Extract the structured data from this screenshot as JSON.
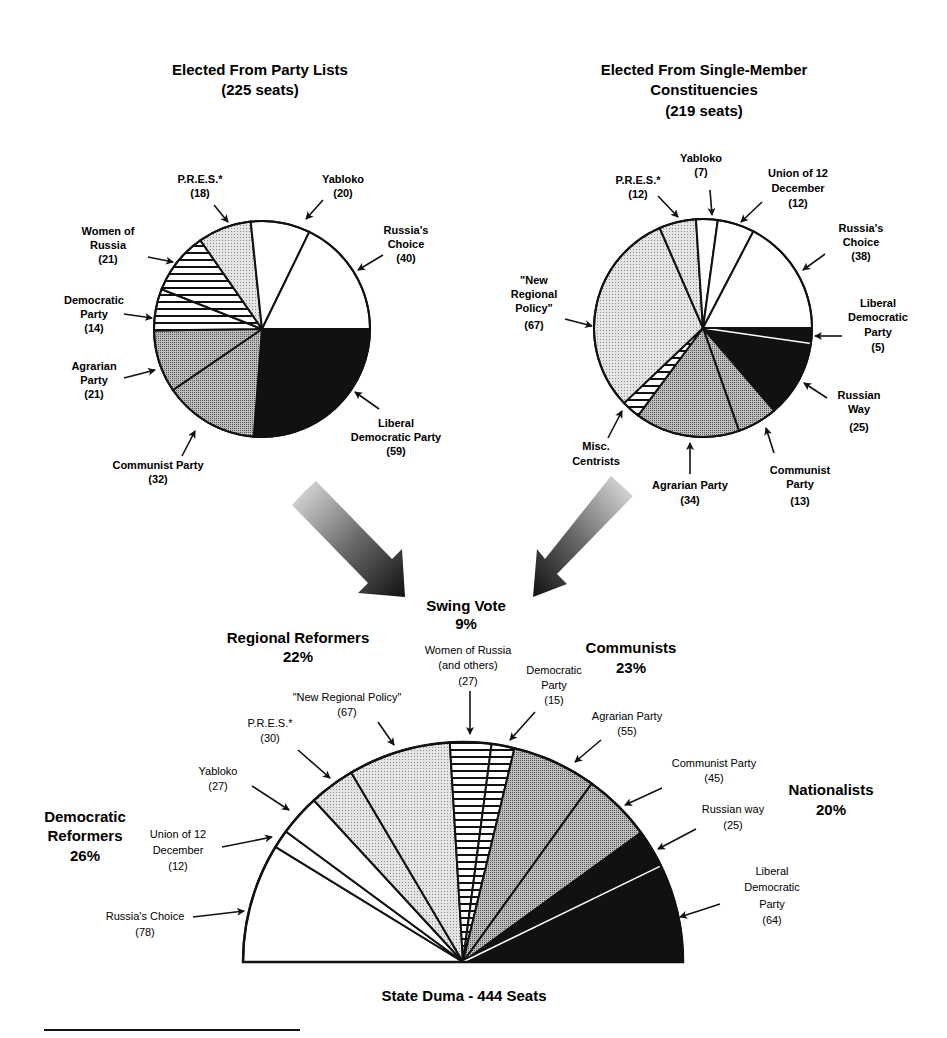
{
  "chart_data": [
    {
      "type": "pie",
      "title": "Elected From Party Lists",
      "subtitle": "(225 seats)",
      "categories": [
        "Liberal Democratic Party",
        "Communist Party",
        "Agrarian Party",
        "Democratic Party",
        "Women of Russia",
        "P.R.E.S.*",
        "Yabloko",
        "Russia's Choice"
      ],
      "values": [
        59,
        32,
        21,
        14,
        21,
        18,
        20,
        40
      ],
      "total": 225
    },
    {
      "type": "pie",
      "title": "Elected From Single-Member Constituencies",
      "subtitle": "(219 seats)",
      "categories": [
        "Liberal Democratic Party",
        "Russian Way",
        "Communist Party",
        "Agrarian Party",
        "Misc. Centrists",
        "\"New Regional Policy\"",
        "P.R.E.S.*",
        "Yabloko",
        "Union of 12 December",
        "Russia's Choice"
      ],
      "values": [
        5,
        25,
        13,
        34,
        6,
        67,
        12,
        7,
        12,
        38
      ],
      "total": 219
    },
    {
      "type": "pie",
      "subtype": "semicircle",
      "title": "State Duma - 444 Seats",
      "categories": [
        "Russia's Choice",
        "Union of 12 December",
        "Yabloko",
        "P.R.E.S.*",
        "\"New Regional Policy\"",
        "Women of Russia (and others)",
        "Democratic Party",
        "Agrarian Party",
        "Communist Party",
        "Russian way",
        "Liberal Democratic Party"
      ],
      "values": [
        78,
        12,
        27,
        30,
        67,
        27,
        15,
        55,
        45,
        25,
        64
      ],
      "blocs": [
        {
          "name": "Democratic Reformers",
          "share": "26%"
        },
        {
          "name": "Regional Reformers",
          "share": "22%"
        },
        {
          "name": "Swing Vote",
          "share": "9%"
        },
        {
          "name": "Communists",
          "share": "23%"
        },
        {
          "name": "Nationalists",
          "share": "20%"
        }
      ]
    }
  ],
  "left": {
    "title1": "Elected From Party Lists",
    "title2": "(225 seats)",
    "labels": {
      "pres": [
        "P.R.E.S.*",
        "(18)"
      ],
      "yabloko": [
        "Yabloko",
        "(20)"
      ],
      "russias_choice": [
        "Russia's",
        "Choice",
        "(40)"
      ],
      "women": [
        "Women of",
        "Russia",
        "(21)"
      ],
      "democratic": [
        "Democratic",
        "Party",
        "(14)"
      ],
      "agrarian": [
        "Agrarian",
        "Party",
        "(21)"
      ],
      "ldp": [
        "Liberal",
        "Democratic Party",
        "(59)"
      ],
      "communist": [
        "Communist Party",
        "(32)"
      ]
    }
  },
  "right": {
    "title1": "Elected From Single-Member",
    "title2": "Constituencies",
    "title3": "(219 seats)",
    "labels": {
      "pres": [
        "P.R.E.S.*",
        "(12)"
      ],
      "yabloko": [
        "Yabloko",
        "(7)"
      ],
      "union": [
        "Union of 12",
        "December",
        "(12)"
      ],
      "russias_choice": [
        "Russia's",
        "Choice",
        "(38)"
      ],
      "nrp": [
        "\"New",
        "Regional",
        "Policy\"",
        "(67)"
      ],
      "ldp": [
        "Liberal",
        "Democratic",
        "Party",
        "(5)"
      ],
      "russian_way": [
        "Russian",
        "Way",
        "(25)"
      ],
      "misc": [
        "Misc.",
        "Centrists"
      ],
      "agrarian": [
        "Agrarian Party",
        "(34)"
      ],
      "communist": [
        "Communist",
        "Party",
        "(13)"
      ]
    }
  },
  "bottom": {
    "title": "State Duma - 444 Seats",
    "blocs": {
      "swing": [
        "Swing Vote",
        "9%"
      ],
      "regional": [
        "Regional Reformers",
        "22%"
      ],
      "communists": [
        "Communists",
        "23%"
      ],
      "democratic": [
        "Democratic",
        "Reformers",
        "26%"
      ],
      "nationalists": [
        "Nationalists",
        "20%"
      ]
    },
    "labels": {
      "women": [
        "Women of Russia",
        "(and others)",
        "(27)"
      ],
      "democratic": [
        "Democratic",
        "Party",
        "(15)"
      ],
      "nrp": [
        "\"New Regional Policy\"",
        "(67)"
      ],
      "pres": [
        "P.R.E.S.*",
        "(30)"
      ],
      "yabloko": [
        "Yabloko",
        "(27)"
      ],
      "union": [
        "Union of 12",
        "December",
        "(12)"
      ],
      "russias_choice": [
        "Russia's Choice",
        "(78)"
      ],
      "agrarian": [
        "Agrarian Party",
        "(55)"
      ],
      "communist": [
        "Communist Party",
        "(45)"
      ],
      "russian_way": [
        "Russian way",
        "(25)"
      ],
      "ldp": [
        "Liberal",
        "Democratic",
        "Party",
        "(64)"
      ]
    }
  },
  "colors": {
    "white": "#ffffff",
    "light_dots": "#d9d9d9",
    "mid_dots": "#a8a8a8",
    "black": "#111111",
    "outline": "#111111"
  }
}
